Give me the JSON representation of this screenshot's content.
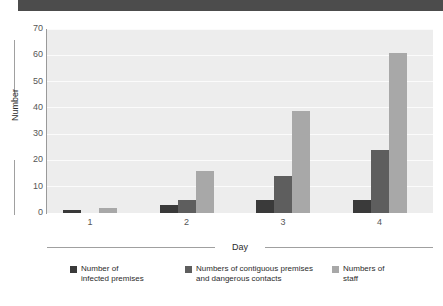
{
  "banner": {
    "name": "top-banner"
  },
  "chart_data": {
    "type": "bar",
    "title": "",
    "subtitle": "",
    "xlabel": "Day",
    "ylabel": "Number",
    "categories": [
      "1",
      "2",
      "3",
      "4"
    ],
    "series": [
      {
        "name": "Number of infected premises",
        "label_line1": "Number of",
        "label_line2": "infected premises",
        "color": "#3a3a3a",
        "values": [
          1,
          3,
          5,
          5
        ]
      },
      {
        "name": "Numbers of contiguous premises and dangerous contacts",
        "label_line1": "Numbers of contiguous premises",
        "label_line2": "and dangerous contacts",
        "color": "#5e5e5e",
        "values": [
          0,
          5,
          14,
          24
        ]
      },
      {
        "name": "Numbers of staff",
        "label_line1": "Numbers of",
        "label_line2": "staff",
        "color": "#a8a8a8",
        "values": [
          2,
          16,
          39,
          61
        ]
      }
    ],
    "ylim": [
      0,
      70
    ],
    "yticks": [
      "0",
      "10",
      "20",
      "30",
      "40",
      "50",
      "60",
      "70"
    ],
    "ytick_values": [
      0,
      10,
      20,
      30,
      40,
      50,
      60,
      70
    ],
    "grid": true,
    "grid_axis": "y",
    "legend_position": "bottom",
    "plot_background": "#ededed",
    "gridline_color": "#fbfbfb",
    "axis_color": "#9a9a9a",
    "banner_color": "#4c4c4c"
  }
}
